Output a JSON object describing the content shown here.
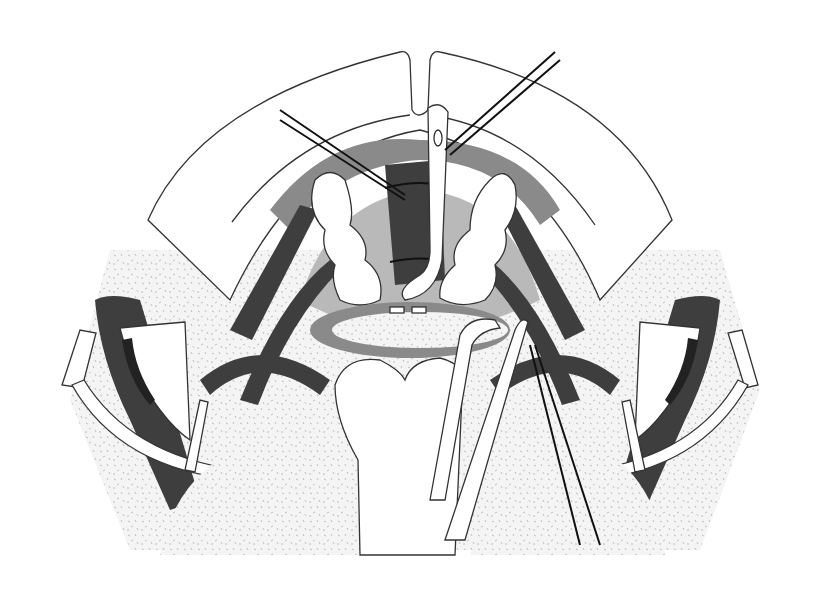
{
  "figure": {
    "title": "",
    "width": 827,
    "height": 605,
    "colors": {
      "background": "#ffffff",
      "outline": "#333333",
      "dark_tissue": "#3e3e3e",
      "mid_tissue": "#8a8a8a",
      "light_tissue": "#b9b9b9",
      "speckle_field": "#f2f2f2"
    },
    "elements": [
      {
        "name": "outer-arch",
        "kind": "outline"
      },
      {
        "name": "inner-arch",
        "kind": "outline"
      },
      {
        "name": "central-tube",
        "kind": "instrument"
      },
      {
        "name": "left-lobe",
        "kind": "tissue"
      },
      {
        "name": "right-lobe",
        "kind": "tissue"
      },
      {
        "name": "oval-specimen-plate",
        "kind": "tissue"
      },
      {
        "name": "left-retractor",
        "kind": "instrument"
      },
      {
        "name": "right-retractor",
        "kind": "instrument"
      },
      {
        "name": "forceps",
        "kind": "instrument"
      },
      {
        "name": "suture-threads",
        "kind": "instrument"
      },
      {
        "name": "drape-field",
        "kind": "background"
      }
    ]
  }
}
